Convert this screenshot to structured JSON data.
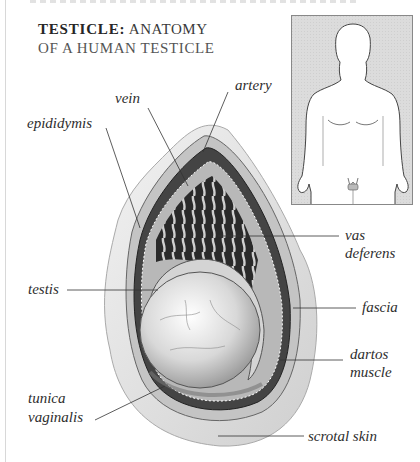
{
  "title": {
    "bold": "TESTICLE:",
    "line1_rest": " ANATOMY",
    "line2": "OF A HUMAN TESTICLE"
  },
  "inset": {
    "description": "Outline of male body showing location of testicles",
    "background": "#dcdcdc",
    "border": "#888888"
  },
  "labels": {
    "vein": "vein",
    "artery": "artery",
    "epididymis": "epididymis",
    "vas_deferens_1": "vas",
    "vas_deferens_2": "deferens",
    "testis": "testis",
    "fascia": "fascia",
    "dartos_1": "dartos",
    "dartos_2": "muscle",
    "tunica_1": "tunica",
    "tunica_2": "vaginalis",
    "scrotal_skin": "scrotal skin"
  },
  "colors": {
    "text": "#2e2e2e",
    "leader_line": "#333333",
    "skin_light": "#e8e8e8",
    "tissue_mid": "#9a9a9a",
    "tissue_dark": "#3a3a3a"
  }
}
